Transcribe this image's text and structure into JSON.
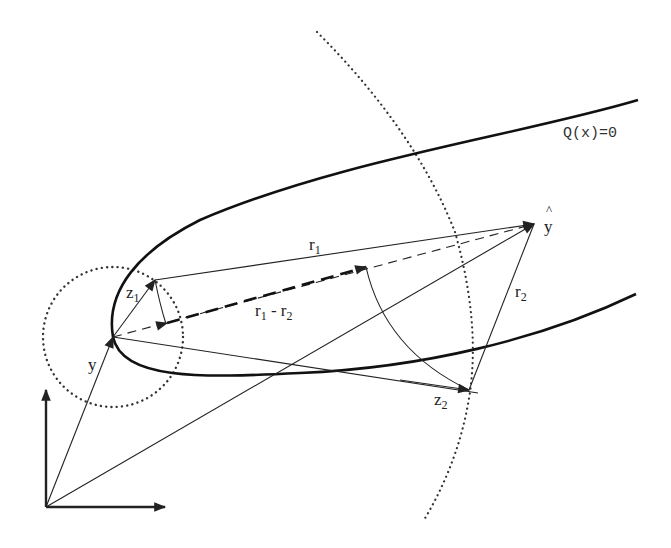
{
  "diagram": {
    "type": "geometric-construction",
    "curve": {
      "label": "Q(x)=0",
      "description": "parabola-like surface with vertex at y"
    },
    "points": {
      "origin": {
        "x": 46,
        "y": 507
      },
      "y": {
        "label": "y",
        "x": 113,
        "y": 337
      },
      "y_hat": {
        "label": "y",
        "hat": "^",
        "x": 534,
        "y": 224
      },
      "z1": {
        "label": "z",
        "sub": "1",
        "x": 155,
        "y": 280
      },
      "z2": {
        "label": "z",
        "sub": "2",
        "x": 469,
        "y": 390
      }
    },
    "vectors": {
      "r1": {
        "label": "r",
        "sub": "1"
      },
      "r2": {
        "label": "r",
        "sub": "2"
      },
      "r1_minus_r2": {
        "label_a": "r",
        "sub_a": "1",
        "op": " - ",
        "label_b": "r",
        "sub_b": "2"
      }
    },
    "circles": {
      "small_dotted": {
        "cx": 113,
        "cy": 337,
        "r": 70
      },
      "large_dotted_arc": {
        "description": "dotted circular arc centered near y through z2"
      }
    },
    "axes": {
      "x_arrow": true,
      "y_arrow": true
    }
  },
  "colors": {
    "ink": "#222222",
    "background": "#ffffff"
  }
}
